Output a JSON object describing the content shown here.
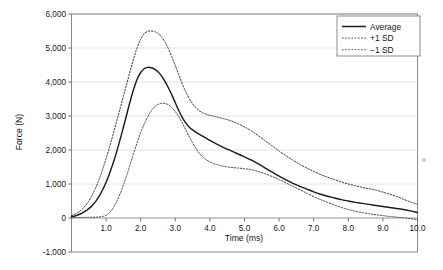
{
  "chart_data": {
    "type": "line",
    "title": "",
    "xlabel": "Time (ms)",
    "ylabel": "Force (N)",
    "xlim": [
      0.0,
      10.0
    ],
    "ylim": [
      -1000,
      6000
    ],
    "grid": "horizontal",
    "legend_position": "top-right",
    "x_ticks": [
      "1.0",
      "2.0",
      "3.0",
      "4.0",
      "5.0",
      "6.0",
      "7.0",
      "8.0",
      "9.0",
      "10.0"
    ],
    "x_tick_values": [
      1.0,
      2.0,
      3.0,
      4.0,
      5.0,
      6.0,
      7.0,
      8.0,
      9.0,
      10.0
    ],
    "y_ticks": [
      "6,000",
      "5,000",
      "4,000",
      "3,000",
      "2,000",
      "1,000",
      "0",
      "-1,000"
    ],
    "y_tick_values": [
      6000,
      5000,
      4000,
      3000,
      2000,
      1000,
      0,
      -1000
    ],
    "x": [
      0.0,
      0.1,
      0.2,
      0.3,
      0.4,
      0.5,
      0.6,
      0.7,
      0.8,
      0.9,
      1.0,
      1.1,
      1.2,
      1.3,
      1.4,
      1.5,
      1.6,
      1.7,
      1.8,
      1.9,
      2.0,
      2.1,
      2.2,
      2.3,
      2.4,
      2.5,
      2.6,
      2.7,
      2.8,
      2.9,
      3.0,
      3.1,
      3.2,
      3.3,
      3.4,
      3.5,
      3.6,
      3.7,
      3.8,
      3.9,
      4.0,
      4.2,
      4.4,
      4.6,
      4.8,
      5.0,
      5.2,
      5.4,
      5.6,
      5.8,
      6.0,
      6.2,
      6.4,
      6.6,
      6.8,
      7.0,
      7.2,
      7.4,
      7.6,
      7.8,
      8.0,
      8.2,
      8.4,
      8.6,
      8.8,
      9.0,
      9.2,
      9.4,
      9.6,
      9.8,
      10.0
    ],
    "series": [
      {
        "name": "Average",
        "style": "solid",
        "color": "#1d1d1d",
        "peak_value": 4430,
        "peak_time": 2.55,
        "values": [
          40,
          60,
          95,
          140,
          200,
          275,
          370,
          490,
          640,
          830,
          1050,
          1310,
          1600,
          1930,
          2290,
          2670,
          3060,
          3450,
          3800,
          4090,
          4280,
          4390,
          4430,
          4420,
          4380,
          4300,
          4180,
          4020,
          3830,
          3620,
          3390,
          3160,
          2960,
          2800,
          2680,
          2590,
          2520,
          2460,
          2400,
          2340,
          2280,
          2170,
          2070,
          1980,
          1890,
          1800,
          1700,
          1590,
          1470,
          1350,
          1230,
          1120,
          1020,
          930,
          850,
          770,
          700,
          640,
          590,
          540,
          500,
          460,
          430,
          400,
          370,
          340,
          310,
          280,
          250,
          210,
          160
        ]
      },
      {
        "name": "+1 SD",
        "style": "dotted",
        "color": "#3a3a3a",
        "peak_value": 5500,
        "peak_time": 2.5,
        "values": [
          70,
          110,
          170,
          250,
          360,
          500,
          680,
          890,
          1140,
          1430,
          1750,
          2090,
          2450,
          2820,
          3200,
          3580,
          3960,
          4340,
          4700,
          5020,
          5260,
          5420,
          5490,
          5500,
          5480,
          5430,
          5330,
          5180,
          4980,
          4740,
          4480,
          4210,
          3950,
          3720,
          3520,
          3360,
          3240,
          3150,
          3090,
          3050,
          3020,
          2970,
          2920,
          2860,
          2780,
          2680,
          2560,
          2420,
          2270,
          2120,
          1970,
          1830,
          1700,
          1580,
          1470,
          1370,
          1280,
          1200,
          1130,
          1060,
          1000,
          950,
          900,
          860,
          820,
          760,
          700,
          630,
          550,
          470,
          400
        ]
      },
      {
        "name": "-1 SD",
        "style": "dotted",
        "color": "#4a4a4a",
        "peak_value": 3370,
        "peak_time": 2.7,
        "values": [
          10,
          12,
          14,
          16,
          18,
          20,
          22,
          25,
          30,
          45,
          80,
          160,
          290,
          470,
          700,
          970,
          1270,
          1590,
          1910,
          2220,
          2510,
          2760,
          2970,
          3140,
          3270,
          3340,
          3370,
          3370,
          3330,
          3250,
          3130,
          2980,
          2800,
          2600,
          2400,
          2210,
          2040,
          1900,
          1790,
          1710,
          1650,
          1570,
          1520,
          1490,
          1470,
          1450,
          1420,
          1370,
          1300,
          1220,
          1130,
          1030,
          930,
          830,
          730,
          630,
          540,
          460,
          380,
          310,
          250,
          200,
          160,
          125,
          95,
          70,
          45,
          25,
          5,
          -20,
          -50
        ]
      }
    ]
  },
  "legend": {
    "items": [
      {
        "label": "Average"
      },
      {
        "label": "+1 SD"
      },
      {
        "label": "−1 SD"
      }
    ]
  },
  "axis": {
    "x_title": "Time (ms)",
    "y_title": "Force (N)"
  }
}
